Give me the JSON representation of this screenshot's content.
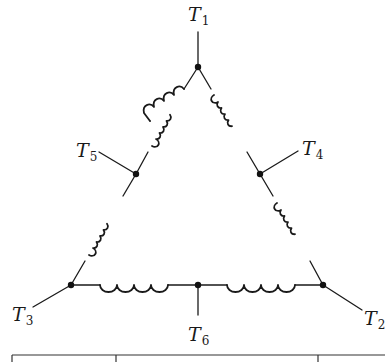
{
  "diagram": {
    "type": "delta-connected three-phase winding with center taps",
    "colors": {
      "line": "#1a1a1a",
      "node": "#111111",
      "background": "#ffffff"
    },
    "terminals": [
      {
        "id": "T1",
        "letter": "T",
        "sub": "1",
        "node": [
          198,
          67
        ],
        "lead_end": [
          198,
          32
        ],
        "label_pos": [
          187,
          4
        ]
      },
      {
        "id": "T2",
        "letter": "T",
        "sub": "2",
        "node": [
          323,
          285
        ],
        "lead_end": [
          362,
          310
        ],
        "label_pos": [
          364,
          311
        ]
      },
      {
        "id": "T3",
        "letter": "T",
        "sub": "3",
        "node": [
          71,
          285
        ],
        "lead_end": [
          33,
          307
        ],
        "label_pos": [
          12,
          307
        ]
      },
      {
        "id": "T4",
        "letter": "T",
        "sub": "4",
        "node": [
          260,
          174
        ],
        "lead_end": [
          298,
          151
        ],
        "label_pos": [
          302,
          139
        ]
      },
      {
        "id": "T5",
        "letter": "T",
        "sub": "5",
        "node": [
          136,
          174
        ],
        "lead_end": [
          99,
          152
        ],
        "label_pos": [
          76,
          141
        ]
      },
      {
        "id": "T6",
        "letter": "T",
        "sub": "6",
        "node": [
          198,
          285
        ],
        "lead_end": [
          198,
          315
        ],
        "label_pos": [
          187,
          326
        ]
      }
    ],
    "coils": [
      {
        "id": "coil-T1-T5",
        "from": "T1",
        "to": "T5",
        "turns": 4
      },
      {
        "id": "coil-T1-T4",
        "from": "T1",
        "to": "T4",
        "turns": 4
      },
      {
        "id": "coil-T5-T3",
        "from": "T5",
        "to": "T3",
        "turns": 4
      },
      {
        "id": "coil-T4-T2",
        "from": "T4",
        "to": "T2",
        "turns": 4
      },
      {
        "id": "coil-T3-T6",
        "from": "T3",
        "to": "T6",
        "turns": 4
      },
      {
        "id": "coil-T6-T2",
        "from": "T6",
        "to": "T2",
        "turns": 4
      }
    ],
    "table_partial": {
      "top_y": 355,
      "columns_x": [
        12,
        116,
        318
      ],
      "right_x": 385
    }
  },
  "labels": {
    "t1": {
      "letter": "T",
      "sub": "1"
    },
    "t2": {
      "letter": "T",
      "sub": "2"
    },
    "t3": {
      "letter": "T",
      "sub": "3"
    },
    "t4": {
      "letter": "T",
      "sub": "4"
    },
    "t5": {
      "letter": "T",
      "sub": "5"
    },
    "t6": {
      "letter": "T",
      "sub": "6"
    }
  }
}
